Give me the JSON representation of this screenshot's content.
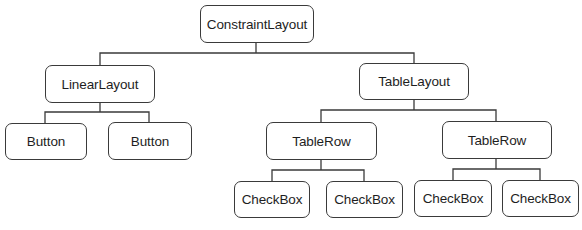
{
  "diagram": {
    "type": "tree",
    "root": {
      "label": "ConstraintLayout",
      "children": [
        {
          "label": "LinearLayout",
          "children": [
            {
              "label": "Button"
            },
            {
              "label": "Button"
            }
          ]
        },
        {
          "label": "TableLayout",
          "children": [
            {
              "label": "TableRow",
              "children": [
                {
                  "label": "CheckBox"
                },
                {
                  "label": "CheckBox"
                }
              ]
            },
            {
              "label": "TableRow",
              "children": [
                {
                  "label": "CheckBox"
                },
                {
                  "label": "CheckBox"
                }
              ]
            }
          ]
        }
      ]
    }
  },
  "colors": {
    "line": "#3a3a3a",
    "text": "#1e1e1e",
    "background": "#ffffff"
  }
}
